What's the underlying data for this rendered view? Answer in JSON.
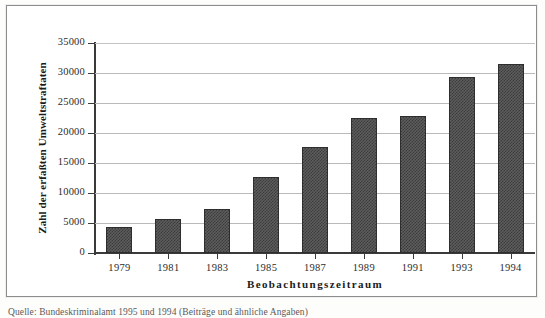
{
  "chart_data": {
    "type": "bar",
    "title": "",
    "xlabel": "Beobachtungszeitraum",
    "ylabel": "Zahl der erfaßten Umweltstraftaten",
    "categories": [
      "1979",
      "1981",
      "1983",
      "1985",
      "1987",
      "1989",
      "1991",
      "1993",
      "1994"
    ],
    "values": [
      4300,
      5700,
      7300,
      12600,
      17700,
      22500,
      22900,
      29300,
      31500
    ],
    "ylim": [
      0,
      35000
    ],
    "ytick_labels": [
      "0",
      "5000",
      "10000",
      "15000",
      "20000",
      "25000",
      "30000",
      "35000"
    ],
    "ytick_values": [
      0,
      5000,
      10000,
      15000,
      20000,
      25000,
      30000,
      35000
    ],
    "grid": true,
    "legend": "none",
    "series": [
      {
        "name": "Umweltstraftaten",
        "values": [
          4300,
          5700,
          7300,
          12600,
          17700,
          22500,
          22900,
          29300,
          31500
        ]
      }
    ]
  },
  "caption": {
    "text": "Quelle: Bundeskriminalamt 1995 und 1994 (Beiträge und ähnliche Angaben)"
  },
  "colors": {
    "bar_fill": "#5d5d5d",
    "bar_pattern": "#3c3c3c",
    "bar_border": "#2e2e2e",
    "axis": "#3a3a3a",
    "gridline": "#b9b9b9",
    "frame": "#8d8d8d",
    "text": "#1b1b1b",
    "background": "#ffffff"
  }
}
